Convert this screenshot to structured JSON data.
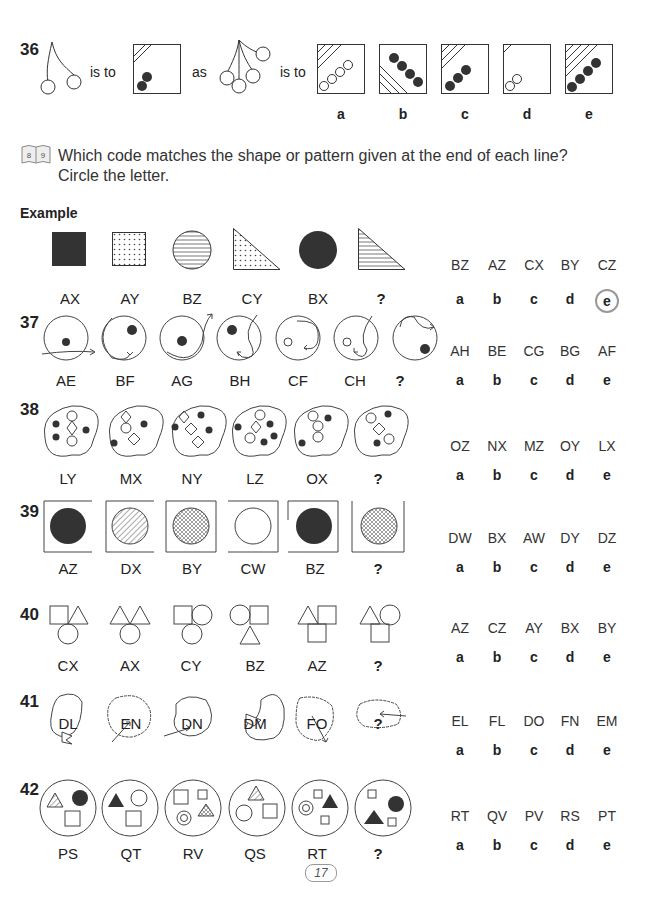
{
  "page_number": "17",
  "q36": {
    "number": "36",
    "is_to_1": "is to",
    "as": "as",
    "is_to_2": "is to",
    "letters": [
      "a",
      "b",
      "c",
      "d",
      "e"
    ]
  },
  "instruction": {
    "icon": "book-icon",
    "icon_pages": [
      "8",
      "9"
    ],
    "line1": "Which code matches the shape or pattern given at the end of each line?",
    "line2": "Circle the letter."
  },
  "example": {
    "heading": "Example",
    "labels": [
      "AX",
      "AY",
      "BZ",
      "CY",
      "BX",
      "?"
    ],
    "options": [
      "BZ",
      "AZ",
      "CX",
      "BY",
      "CZ"
    ],
    "letters": [
      "a",
      "b",
      "c",
      "d",
      "e"
    ],
    "circled": "e"
  },
  "questions": [
    {
      "number": "37",
      "labels": [
        "AE",
        "BF",
        "AG",
        "BH",
        "CF",
        "CH",
        "?"
      ],
      "options": [
        "AH",
        "BE",
        "CG",
        "BG",
        "AF"
      ],
      "letters": [
        "a",
        "b",
        "c",
        "d",
        "e"
      ]
    },
    {
      "number": "38",
      "labels": [
        "LY",
        "MX",
        "NY",
        "LZ",
        "OX",
        "?"
      ],
      "options": [
        "OZ",
        "NX",
        "MZ",
        "OY",
        "LX"
      ],
      "letters": [
        "a",
        "b",
        "c",
        "d",
        "e"
      ]
    },
    {
      "number": "39",
      "labels": [
        "AZ",
        "DX",
        "BY",
        "CW",
        "BZ",
        "?"
      ],
      "options": [
        "DW",
        "BX",
        "AW",
        "DY",
        "DZ"
      ],
      "letters": [
        "a",
        "b",
        "c",
        "d",
        "e"
      ]
    },
    {
      "number": "40",
      "labels": [
        "CX",
        "AX",
        "CY",
        "BZ",
        "AZ",
        "?"
      ],
      "options": [
        "AZ",
        "CZ",
        "AY",
        "BX",
        "BY"
      ],
      "letters": [
        "a",
        "b",
        "c",
        "d",
        "e"
      ]
    },
    {
      "number": "41",
      "labels": [
        "DL",
        "EN",
        "DN",
        "DM",
        "FO",
        "?"
      ],
      "options": [
        "EL",
        "FL",
        "DO",
        "FN",
        "EM"
      ],
      "letters": [
        "a",
        "b",
        "c",
        "d",
        "e"
      ]
    },
    {
      "number": "42",
      "labels": [
        "PS",
        "QT",
        "RV",
        "QS",
        "RT",
        "?"
      ],
      "options": [
        "RT",
        "QV",
        "PV",
        "RS",
        "PT"
      ],
      "letters": [
        "a",
        "b",
        "c",
        "d",
        "e"
      ]
    }
  ]
}
